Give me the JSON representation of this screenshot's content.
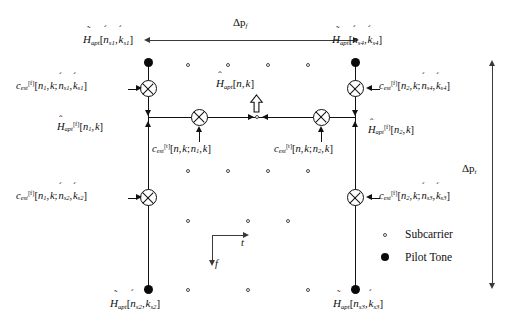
{
  "figure": {
    "type": "signal-processing-diagram",
    "dimension_labels": {
      "horizontal": {
        "symbol": "Δp",
        "subscript": "f"
      },
      "vertical": {
        "symbol": "Δp",
        "subscript": "t"
      }
    },
    "axes": {
      "horizontal_axis": "t",
      "vertical_axis": "f"
    },
    "legend": [
      {
        "marker": "open-circle",
        "label": "Subcarrier"
      },
      {
        "marker": "filled-circle",
        "label": "Pilot Tone"
      }
    ],
    "pilots": [
      {
        "id": "s1",
        "base": "H",
        "accent": "tilde",
        "sub": "apt",
        "args": "[ń s1 , ķ s1]",
        "position": "top-left"
      },
      {
        "id": "s4",
        "base": "H",
        "accent": "tilde",
        "sub": "apt",
        "args": "[ń s4 , ķ s4]",
        "position": "top-right"
      },
      {
        "id": "s2",
        "base": "H",
        "accent": "tilde",
        "sub": "apt",
        "args": "[ń s2 , ķ s2]",
        "position": "bottom-left"
      },
      {
        "id": "s3",
        "base": "H",
        "accent": "tilde",
        "sub": "apt",
        "args": "[ń s3 , ķ s3]",
        "position": "bottom-right"
      }
    ],
    "coefficients": {
      "f_top_left": "c_est^[f][n1, k; ń s1, ķ s1]",
      "f_bottom_left": "c_est^[f][n1, k; ń s2, ķ s2]",
      "f_top_right": "c_est^[f][n2, k; ń s4, ķ s4]",
      "f_bottom_right": "c_est^[f][n2, k; ń s3, ķ s3]",
      "t_left": "c_est^[t][n, k; n1, k]",
      "t_right": "c_est^[t][n, k; n2, k]"
    },
    "estimates": {
      "left": "Ĥ_apt^[f][n1, k]",
      "right": "Ĥ_apt^[f][n2, k]",
      "centre": "Ĥ_apt[n, k]"
    }
  },
  "text": {
    "dp_f_symbol": "Δp",
    "dp_f_sub": "f",
    "dp_t_symbol": "Δp",
    "dp_t_sub": "t",
    "axis_t": "t",
    "axis_f": "f",
    "legend_subcarrier": "Subcarrier",
    "legend_pilot": "Pilot Tone"
  },
  "colors": {
    "ink": "#0d0d0d",
    "rule": "#111111",
    "thin_rule": "#3a3a3a",
    "background": "#ffffff"
  }
}
